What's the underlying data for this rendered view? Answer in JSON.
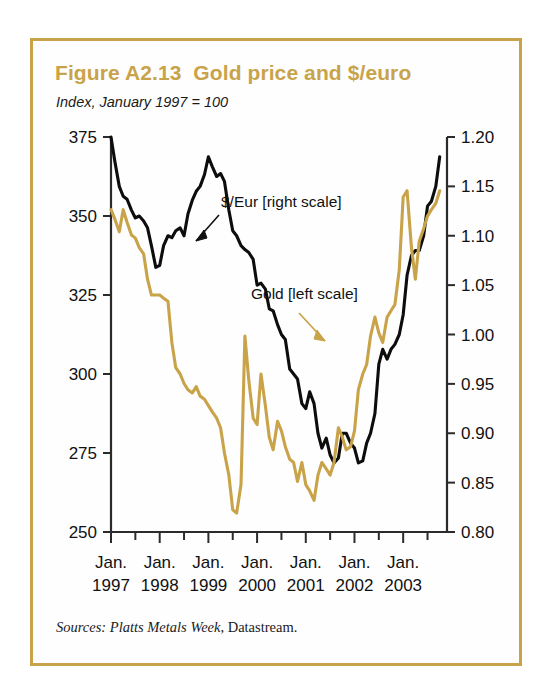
{
  "figure": {
    "title": "Figure A2.13  Gold price and $/euro",
    "subtitle": "Index, January 1997 = 100",
    "source_label": "Sources: ",
    "source_italic": "Platts Metals Week",
    "source_rest": ", Datastream.",
    "border_color": "#c9a349",
    "gold_color": "#c9a349",
    "black_color": "#0d0d0d"
  },
  "chart_data": {
    "type": "line",
    "title": "Figure A2.13  Gold price and $/euro",
    "subtitle": "Index, January 1997 = 100",
    "xlabel": "",
    "ylabel": "",
    "grid": false,
    "legend_position": "inline-annotations",
    "x_tick_labels_line1": [
      "Jan.",
      "Jan.",
      "Jan.",
      "Jan.",
      "Jan.",
      "Jan.",
      "Jan."
    ],
    "x_tick_labels_line2": [
      "1997",
      "1998",
      "1999",
      "2000",
      "2001",
      "2002",
      "2003"
    ],
    "x_major_ticks": [
      1997.0,
      1998.0,
      1999.0,
      2000.0,
      2001.0,
      2002.0,
      2003.0
    ],
    "x_minor_ticks": [
      1997.5,
      1998.5,
      1999.5,
      2000.5,
      2001.5,
      2002.5,
      2003.5
    ],
    "xlim": [
      1997.0,
      2003.9
    ],
    "left_axis": {
      "name": "Gold [left scale]",
      "ticks": [
        250,
        275,
        300,
        325,
        350,
        375
      ],
      "tick_labels": [
        "250",
        "275",
        "300",
        "325",
        "350",
        "375"
      ],
      "ylim": [
        250,
        375
      ]
    },
    "right_axis": {
      "name": "$/Eur [right scale]",
      "ticks": [
        0.8,
        0.85,
        0.9,
        0.95,
        1.0,
        1.05,
        1.1,
        1.15,
        1.2
      ],
      "tick_labels": [
        "0.80",
        "0.85",
        "0.90",
        "0.95",
        "1.00",
        "1.05",
        "1.10",
        "1.15",
        "1.20"
      ],
      "ylim": [
        0.8,
        1.2
      ]
    },
    "annotations": [
      {
        "text": "$/Eur [right scale]",
        "series": "dollar-euro",
        "color": "#111111"
      },
      {
        "text": "Gold [left scale]",
        "series": "gold",
        "color": "#c9a349"
      }
    ],
    "series": [
      {
        "name": "$/Eur [right scale]",
        "axis": "right",
        "color": "#0d0d0d",
        "x": [
          1997.0,
          1997.08,
          1997.17,
          1997.25,
          1997.33,
          1997.42,
          1997.5,
          1997.58,
          1997.67,
          1997.75,
          1997.83,
          1997.92,
          1998.0,
          1998.08,
          1998.17,
          1998.25,
          1998.33,
          1998.42,
          1998.5,
          1998.58,
          1998.67,
          1998.75,
          1998.83,
          1998.92,
          1999.0,
          1999.08,
          1999.17,
          1999.25,
          1999.33,
          1999.42,
          1999.5,
          1999.58,
          1999.67,
          1999.75,
          1999.83,
          1999.92,
          2000.0,
          2000.08,
          2000.17,
          2000.25,
          2000.33,
          2000.42,
          2000.5,
          2000.58,
          2000.67,
          2000.75,
          2000.83,
          2000.92,
          2001.0,
          2001.08,
          2001.17,
          2001.25,
          2001.33,
          2001.42,
          2001.5,
          2001.58,
          2001.67,
          2001.75,
          2001.83,
          2001.92,
          2002.0,
          2002.08,
          2002.17,
          2002.25,
          2002.33,
          2002.42,
          2002.5,
          2002.58,
          2002.67,
          2002.75,
          2002.83,
          2002.92,
          2003.0,
          2003.08,
          2003.17,
          2003.25,
          2003.33,
          2003.42,
          2003.5,
          2003.58,
          2003.67,
          2003.75
        ],
        "y": [
          1.2,
          1.175,
          1.15,
          1.14,
          1.137,
          1.126,
          1.118,
          1.12,
          1.115,
          1.108,
          1.09,
          1.068,
          1.07,
          1.09,
          1.1,
          1.098,
          1.105,
          1.108,
          1.1,
          1.122,
          1.136,
          1.145,
          1.15,
          1.162,
          1.18,
          1.17,
          1.16,
          1.163,
          1.155,
          1.126,
          1.105,
          1.1,
          1.09,
          1.086,
          1.083,
          1.076,
          1.05,
          1.052,
          1.046,
          1.026,
          1.024,
          1.01,
          1.0,
          0.995,
          0.965,
          0.96,
          0.955,
          0.93,
          0.925,
          0.942,
          0.93,
          0.9,
          0.885,
          0.895,
          0.878,
          0.87,
          0.875,
          0.9,
          0.9,
          0.89,
          0.885,
          0.87,
          0.872,
          0.89,
          0.9,
          0.92,
          0.97,
          0.985,
          0.975,
          0.985,
          0.99,
          1.0,
          1.02,
          1.06,
          1.08,
          1.085,
          1.085,
          1.1,
          1.13,
          1.135,
          1.15,
          1.18
        ]
      },
      {
        "name": "Gold [left scale]",
        "axis": "left",
        "color": "#c9a349",
        "x": [
          1997.0,
          1997.08,
          1997.17,
          1997.25,
          1997.33,
          1997.42,
          1997.5,
          1997.58,
          1997.67,
          1997.75,
          1997.83,
          1997.92,
          1998.0,
          1998.08,
          1998.17,
          1998.25,
          1998.33,
          1998.42,
          1998.5,
          1998.58,
          1998.67,
          1998.75,
          1998.83,
          1998.92,
          1999.0,
          1999.08,
          1999.17,
          1999.25,
          1999.33,
          1999.42,
          1999.5,
          1999.58,
          1999.67,
          1999.75,
          1999.83,
          1999.92,
          2000.0,
          2000.08,
          2000.17,
          2000.25,
          2000.33,
          2000.42,
          2000.5,
          2000.58,
          2000.67,
          2000.75,
          2000.83,
          2000.92,
          2001.0,
          2001.08,
          2001.17,
          2001.25,
          2001.33,
          2001.42,
          2001.5,
          2001.58,
          2001.67,
          2001.75,
          2001.83,
          2001.92,
          2002.0,
          2002.08,
          2002.17,
          2002.25,
          2002.33,
          2002.42,
          2002.5,
          2002.58,
          2002.67,
          2002.75,
          2002.83,
          2002.92,
          2003.0,
          2003.08,
          2003.17,
          2003.25,
          2003.33,
          2003.42,
          2003.5,
          2003.58,
          2003.67,
          2003.75
        ],
        "y": [
          352.0,
          349.0,
          345.0,
          352.0,
          348.0,
          344.0,
          343.0,
          340.0,
          338.0,
          330.0,
          325.0,
          325.0,
          325.0,
          324.0,
          323.0,
          310.0,
          302.0,
          300.0,
          297.0,
          295.0,
          294.0,
          296.0,
          293.0,
          292.0,
          290.0,
          288.0,
          286.0,
          283.0,
          275.0,
          268.0,
          257.0,
          256.0,
          265.0,
          312.0,
          298.0,
          286.0,
          284.0,
          300.0,
          290.0,
          280.0,
          276.0,
          285.0,
          282.0,
          277.0,
          273.0,
          272.0,
          266.0,
          272.0,
          265.0,
          263.0,
          260.0,
          268.0,
          272.0,
          270.0,
          268.0,
          272.0,
          283.0,
          280.0,
          276.0,
          277.0,
          282.0,
          295.0,
          300.0,
          303.0,
          312.0,
          318.0,
          313.0,
          310.0,
          318.0,
          320.0,
          322.0,
          333.0,
          356.0,
          358.0,
          340.0,
          330.0,
          342.0,
          346.0,
          350.0,
          352.0,
          354.0,
          358.0
        ]
      }
    ]
  }
}
